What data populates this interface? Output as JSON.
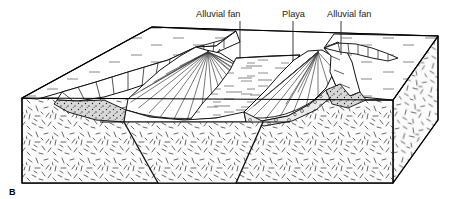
{
  "figure": {
    "panel_label": "B",
    "caption_text": "",
    "width": 455,
    "height": 199
  },
  "colors": {
    "ink": "#000000",
    "line": "#111111",
    "paper": "#ffffff",
    "bedrock_fill": "#fbfbfb",
    "bedrock_hatch": "#555555",
    "plateau_fill": "#ffffff",
    "plateau_dash": "#6a6a6a",
    "fan_fill": "#ffffff",
    "fan_ray": "#3a3a3a",
    "playa_fill": "#ffffff",
    "playa_dash": "#707070",
    "gravel_fill": "#e8e8e8",
    "gravel_dot": "#303030",
    "label_text": "#1a1a1a"
  },
  "labels": [
    {
      "id": "alluvial-fan-left",
      "text": "Alluvial fan",
      "text_x": 196,
      "text_y": 17,
      "anchor": "start",
      "leader_x": 240,
      "leader_y1": 21,
      "leader_y2": 57
    },
    {
      "id": "playa",
      "text": "Playa",
      "text_x": 282,
      "text_y": 17,
      "anchor": "start",
      "leader_x": 293,
      "leader_y1": 21,
      "leader_y2": 61
    },
    {
      "id": "alluvial-fan-right",
      "text": "Alluvial fan",
      "text_x": 327,
      "text_y": 17,
      "anchor": "start",
      "leader_x": 341,
      "leader_y1": 21,
      "leader_y2": 55
    }
  ],
  "structures": {
    "type": "graben-block-diagram",
    "description": "Basin-and-range graben with flanking alluvial fans and central playa",
    "features": [
      "left-upland-plateau",
      "left-mountain-front-facets",
      "left-alluvial-fan",
      "central-playa",
      "right-alluvial-fan",
      "right-mountain-front-facets",
      "right-upland-plateau",
      "left-normal-fault",
      "right-normal-fault",
      "bedrock-cross-section",
      "basin-fill-gravel"
    ]
  },
  "geometry": {
    "block_corners": {
      "front_left": [
        22,
        98
      ],
      "front_left_base": [
        22,
        183
      ],
      "front_right": [
        393,
        183
      ],
      "front_right_top": [
        393,
        100
      ],
      "back_right": [
        438,
        36
      ],
      "back_left": [
        152,
        27
      ]
    },
    "faults": [
      {
        "name": "left-normal-fault",
        "top": [
          124,
          122
        ],
        "bottom": [
          158,
          183
        ]
      },
      {
        "name": "right-normal-fault",
        "top": [
          263,
          122
        ],
        "bottom": [
          236,
          183
        ]
      }
    ],
    "basin_floor_y": 122
  }
}
